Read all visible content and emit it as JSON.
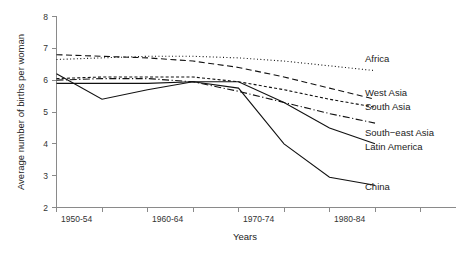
{
  "chart_data": {
    "type": "line",
    "title": "",
    "xlabel": "Years",
    "ylabel": "Average number of births per woman",
    "ylim": [
      2,
      8
    ],
    "yticks": [
      "2",
      "3",
      "4",
      "5",
      "6",
      "7",
      "8"
    ],
    "x": [
      "1950-54",
      "1955-59",
      "1960-64",
      "1965-69",
      "1970-74",
      "1975-79",
      "1980-84",
      "1985-89"
    ],
    "xticklabels": [
      "1950-54",
      "",
      "1960-64",
      "",
      "1970-74",
      "",
      "1980-84",
      ""
    ],
    "grid": false,
    "legend_position": "right-inline",
    "series": [
      {
        "name": "Africa",
        "style": "dotted",
        "label": "Africa",
        "values": [
          6.65,
          6.7,
          6.75,
          6.75,
          6.7,
          6.6,
          6.45,
          6.3
        ]
      },
      {
        "name": "West Asia",
        "style": "dashed",
        "label": "West Asia",
        "values": [
          6.8,
          6.75,
          6.7,
          6.6,
          6.4,
          6.1,
          5.75,
          5.4
        ]
      },
      {
        "name": "South Asia",
        "style": "densely-dotted",
        "label": "South Asia",
        "values": [
          6.05,
          6.1,
          6.1,
          6.1,
          5.95,
          5.7,
          5.4,
          5.15
        ]
      },
      {
        "name": "South-east Asia",
        "style": "dash-dot",
        "label": "South−east Asia",
        "values": [
          6.0,
          6.05,
          6.05,
          5.95,
          5.65,
          5.3,
          4.95,
          4.65
        ]
      },
      {
        "name": "Latin America",
        "style": "solid",
        "label": "Latin America",
        "values": [
          5.9,
          5.9,
          5.9,
          5.95,
          5.95,
          5.3,
          4.5,
          4.0
        ]
      },
      {
        "name": "China",
        "style": "solid",
        "label": "China",
        "values": [
          6.2,
          5.4,
          5.7,
          5.95,
          5.75,
          4.0,
          2.95,
          2.7
        ]
      }
    ]
  }
}
